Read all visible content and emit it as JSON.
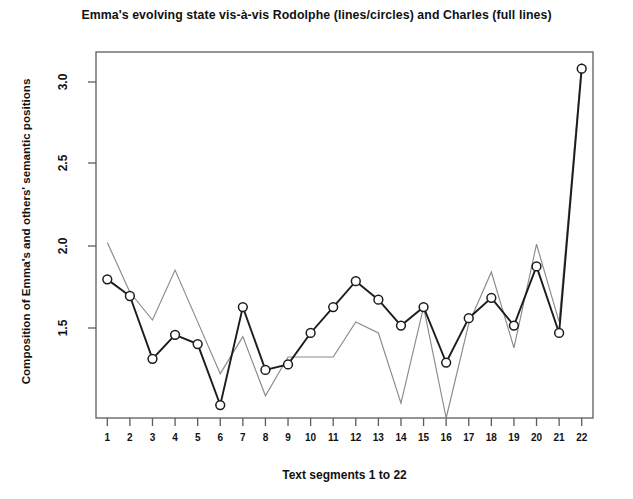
{
  "chart_data": {
    "type": "line",
    "title": "Emma's evolving state vis-à-vis Rodolphe (lines/circles) and Charles (full lines)",
    "xlabel": "Text segments 1 to 22",
    "ylabel": "Composition of Emma's and others' semantic positions",
    "grid": false,
    "legend_position": "none",
    "categories": [
      "1",
      "2",
      "3",
      "4",
      "5",
      "6",
      "7",
      "8",
      "9",
      "10",
      "11",
      "12",
      "13",
      "14",
      "15",
      "16",
      "17",
      "18",
      "19",
      "20",
      "21",
      "22"
    ],
    "x": [
      1,
      2,
      3,
      4,
      5,
      6,
      7,
      8,
      9,
      10,
      11,
      12,
      13,
      14,
      15,
      16,
      17,
      18,
      19,
      20,
      21,
      22
    ],
    "xlim": [
      0.5,
      22.5
    ],
    "ylim": [
      1.2,
      3.18
    ],
    "yticks": [
      "1.5",
      "2.0",
      "2.5",
      "3.0"
    ],
    "ytick_values": [
      1.5,
      2.0,
      2.5,
      3.0
    ],
    "series": [
      {
        "name": "Rodolphe (lines/circles)",
        "marker": "circle",
        "color": "#1c1c1c",
        "values": [
          1.95,
          1.86,
          1.52,
          1.65,
          1.6,
          1.27,
          1.8,
          1.46,
          1.49,
          1.66,
          1.8,
          1.94,
          1.84,
          1.7,
          1.8,
          1.5,
          1.74,
          1.85,
          1.7,
          2.02,
          1.66,
          3.09
        ]
      },
      {
        "name": "Charles (full lines)",
        "marker": "none",
        "color": "#8a8a8a",
        "values": [
          2.15,
          1.88,
          1.73,
          2.0,
          1.72,
          1.44,
          1.64,
          1.32,
          1.53,
          1.53,
          1.53,
          1.72,
          1.66,
          1.28,
          1.8,
          1.2,
          1.71,
          1.99,
          1.58,
          2.14,
          1.72,
          3.12
        ]
      }
    ]
  },
  "axes": {
    "ytick_labels": [
      "3.0",
      "2.5",
      "2.0",
      "1.5"
    ],
    "xtick_labels": [
      "1",
      "2",
      "3",
      "4",
      "5",
      "6",
      "7",
      "8",
      "9",
      "10",
      "11",
      "12",
      "13",
      "14",
      "15",
      "16",
      "17",
      "18",
      "19",
      "20",
      "21",
      "22"
    ]
  }
}
